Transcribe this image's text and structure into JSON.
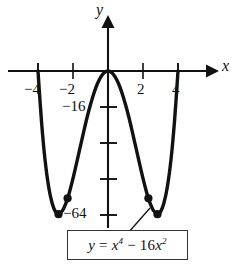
{
  "figure": {
    "kind": "cartesian-graph",
    "background": "#ffffff",
    "ink_color": "#000000"
  },
  "axes": {
    "x_name": "x",
    "y_name": "y",
    "x_ticks": [
      {
        "label": "−4",
        "value": -4
      },
      {
        "label": "−2",
        "value": -2
      },
      {
        "label": "2",
        "value": 2
      },
      {
        "label": "4",
        "value": 4
      }
    ],
    "y_ticks": [
      {
        "label": "−16",
        "value": -16
      },
      {
        "label": "",
        "value": -32
      },
      {
        "label": "",
        "value": -48
      },
      {
        "label": "−64",
        "value": -64
      }
    ]
  },
  "equation_box": {
    "lhs": "y",
    "equals": "=",
    "rhs_base1": "x",
    "rhs_exp1": "4",
    "minus": "−",
    "coef": "16",
    "rhs_base2": "x",
    "rhs_exp2": "2",
    "plain": "y = x⁴ − 16x²"
  },
  "chart_data": {
    "type": "line",
    "title": "",
    "xlabel": "x",
    "ylabel": "y",
    "equation": "y = x^4 - 16x^2",
    "xlim": [
      -4.6,
      4.6
    ],
    "ylim": [
      -72,
      12
    ],
    "grid": false,
    "legend": "none",
    "x": [
      -4.4,
      -4.2,
      -4.0,
      -3.8,
      -3.6,
      -3.4,
      -3.2,
      -3.0,
      -2.828,
      -2.6,
      -2.4,
      -2.309,
      -2.2,
      -2.0,
      -1.8,
      -1.6,
      -1.4,
      -1.2,
      -1.0,
      -0.8,
      -0.6,
      -0.4,
      -0.2,
      0.0,
      0.2,
      0.4,
      0.6,
      0.8,
      1.0,
      1.2,
      1.4,
      1.6,
      1.8,
      2.0,
      2.2,
      2.309,
      2.4,
      2.6,
      2.828,
      3.0,
      3.2,
      3.4,
      3.6,
      3.8,
      4.0,
      4.2,
      4.4
    ],
    "y": [
      65.3,
      29.1,
      0.0,
      -22.5,
      -39.6,
      -51.4,
      -58.9,
      -63.0,
      -64.0,
      -62.4,
      -59.0,
      -56.9,
      -54.1,
      -48.0,
      -41.3,
      -34.4,
      -27.5,
      -20.9,
      -15.0,
      -9.8,
      -5.6,
      -2.5,
      -0.6,
      0.0,
      -0.6,
      -2.5,
      -5.6,
      -9.8,
      -15.0,
      -20.9,
      -27.5,
      -34.4,
      -41.3,
      -48.0,
      -54.1,
      -56.9,
      -59.0,
      -62.4,
      -64.0,
      -63.0,
      -58.9,
      -51.4,
      -39.6,
      -22.5,
      0.0,
      29.1,
      65.3
    ],
    "marked_points": [
      {
        "name": "local-minimum-left",
        "x": -2.828,
        "y": -64
      },
      {
        "name": "inflection-left",
        "x": -2.309,
        "y": -56.9
      },
      {
        "name": "inflection-right",
        "x": 2.309,
        "y": -56.9
      },
      {
        "name": "local-minimum-right",
        "x": 2.828,
        "y": -64
      }
    ],
    "x_roots": [
      -4,
      0,
      4
    ],
    "annotations": [
      {
        "text": "y = x⁴ − 16x²",
        "points_to": "local-minimum-right"
      }
    ]
  }
}
